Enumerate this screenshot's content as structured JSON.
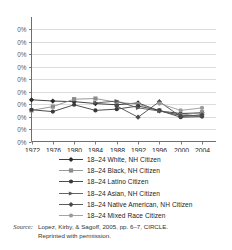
{
  "chart_data": {
    "type": "line",
    "title": "",
    "subtitle": "",
    "xlabel": "",
    "ylabel": "",
    "grid": true,
    "legend_position": "below",
    "x": [
      1972,
      1976,
      1980,
      1984,
      1988,
      1992,
      1996,
      2000,
      2004
    ],
    "xticklabels": [
      "1972",
      "1976",
      "1980",
      "1984",
      "1988",
      "1992",
      "1996",
      "2000",
      "2004"
    ],
    "yticklabels": [
      "0%",
      "0%",
      "0%",
      "0%",
      "0%",
      "0%",
      "0%",
      "0%",
      "0%",
      "0%"
    ],
    "ylim": [
      0,
      10
    ],
    "ytickvalues": [
      0,
      1,
      2,
      3,
      4,
      5,
      6,
      7,
      8,
      9
    ],
    "series": [
      {
        "name": "18–24 White, NH Citizen",
        "marker": "diamond",
        "color": "#2b2b2b",
        "x": [
          1972,
          1976,
          1980,
          1984,
          1988,
          1992,
          1996,
          2000,
          2004
        ],
        "values": [
          3.35,
          3.25,
          3.2,
          3.05,
          2.95,
          3.1,
          2.45,
          2.25,
          2.3
        ]
      },
      {
        "name": "18–24 Black, NH Citizen",
        "marker": "square",
        "color": "#8c8c8c",
        "x": [
          1972,
          1976,
          1980,
          1984,
          1988,
          1992,
          1996,
          2000,
          2004
        ],
        "values": [
          2.5,
          2.8,
          3.4,
          3.45,
          3.15,
          3.0,
          2.5,
          2.1,
          2.35
        ]
      },
      {
        "name": "18–24 Latino Citizen",
        "marker": "circle",
        "color": "#3a3a3a",
        "x": [
          1972,
          1976,
          1980,
          1984,
          1988,
          1992,
          1996,
          2000,
          2004
        ],
        "values": [
          2.55,
          2.4,
          2.95,
          2.5,
          2.6,
          2.85,
          2.5,
          1.95,
          2.0
        ]
      },
      {
        "name": "18–24 Asian, NH Citizen",
        "marker": "triangle",
        "color": "#555555",
        "x": [
          1984,
          1988,
          1992,
          1996,
          2000,
          2004
        ],
        "values": [
          3.1,
          3.25,
          2.7,
          2.45,
          2.1,
          2.05
        ]
      },
      {
        "name": "18–24 Native American, NH Citizen",
        "marker": "diamond",
        "color": "#4a4a4a",
        "x": [
          1988,
          1992,
          1996,
          2000,
          2004
        ],
        "values": [
          2.85,
          1.95,
          3.2,
          2.0,
          2.15
        ]
      },
      {
        "name": "18–24 Mixed Race Citizen",
        "marker": "circle",
        "color": "#9a9a9a",
        "x": [
          1996,
          2000,
          2004
        ],
        "values": [
          3.05,
          2.5,
          2.7
        ]
      }
    ]
  },
  "legend": {
    "items": [
      {
        "label": "18–24 White, NH Citizen",
        "marker": "diamond",
        "color": "#2b2b2b"
      },
      {
        "label": "18–24 Black, NH Citizen",
        "marker": "square",
        "color": "#8c8c8c"
      },
      {
        "label": "18–24 Latino Citizen",
        "marker": "circle",
        "color": "#3a3a3a"
      },
      {
        "label": "18–24 Asian, NH Citizen",
        "marker": "triangle",
        "color": "#555555"
      },
      {
        "label": "18–24 Native American, NH Citizen",
        "marker": "diamond",
        "color": "#4a4a4a"
      },
      {
        "label": "18–24 Mixed Race Citizen",
        "marker": "circle",
        "color": "#9a9a9a"
      }
    ]
  },
  "source": {
    "word": "Source:",
    "line1": "Lopez, Kirby, & Sagoff, 2005, pp. 6–7, CIRCLE.",
    "line2": "Reprinted with permission."
  },
  "colors": {
    "axis": "#6e6e6e",
    "grid": "#d4d4d4",
    "text": "#232323",
    "background": "#ffffff"
  }
}
